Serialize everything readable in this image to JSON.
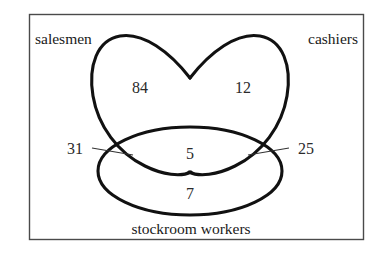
{
  "figure": {
    "type": "venn-diagram",
    "frame": {
      "stroke_color": "#4a4a4a",
      "fill_color": "#ffffff"
    },
    "curve_color": "#111111",
    "text_color": "#1a1a1a"
  },
  "sets": [
    {
      "id": "salesmen",
      "label": "salesmen",
      "shape": "petal",
      "label_position": "top-left"
    },
    {
      "id": "cashiers",
      "label": "cashiers",
      "shape": "petal",
      "label_position": "top-right"
    },
    {
      "id": "stockroom",
      "label": "stockroom workers",
      "shape": "ellipse",
      "label_position": "bottom-center"
    }
  ],
  "regions": [
    {
      "id": "salesmen-only",
      "value": "84",
      "description": "salesmen only"
    },
    {
      "id": "cashiers-only",
      "value": "12",
      "description": "cashiers only"
    },
    {
      "id": "salesmen-stockroom",
      "value": "31",
      "description": "salesmen and stockroom workers only",
      "has_leader_line": true,
      "leader_side": "left"
    },
    {
      "id": "all-three",
      "value": "5",
      "description": "salesmen, cashiers and stockroom workers"
    },
    {
      "id": "cashiers-stockroom",
      "value": "25",
      "description": "cashiers and stockroom workers only",
      "has_leader_line": true,
      "leader_side": "right"
    },
    {
      "id": "stockroom-only",
      "value": "7",
      "description": "stockroom workers only"
    }
  ]
}
